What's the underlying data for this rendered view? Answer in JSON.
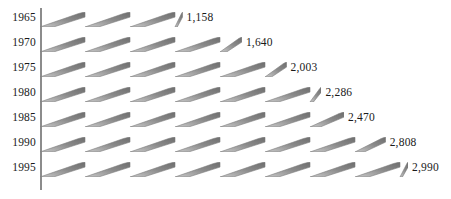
{
  "chart_data": {
    "type": "bar",
    "title": "",
    "subtitle": "",
    "xlabel": "",
    "ylabel": "",
    "orientation": "horizontal",
    "grid": false,
    "legend": null,
    "categories": [
      "1965",
      "1970",
      "1975",
      "1980",
      "1985",
      "1990",
      "1995"
    ],
    "values": [
      1158,
      1640,
      2003,
      2286,
      2470,
      2808,
      2990
    ],
    "value_labels": [
      "1,158",
      "1,640",
      "2,003",
      "2,286",
      "2,470",
      "2,808",
      "2,990"
    ],
    "xlim": [
      0,
      2990
    ],
    "bar_style": "sawtooth-zigzag",
    "bar_color": "#8a8a8a",
    "bar_highlight_color": "#6e6e6e",
    "axis_color": "#8c8c8c",
    "text_color": "#1a1a1a",
    "background_color": "#ffffff"
  },
  "rows": [
    {
      "year": "1965",
      "value": 1158,
      "label": "1,158"
    },
    {
      "year": "1970",
      "value": 1640,
      "label": "1,640"
    },
    {
      "year": "1975",
      "value": 2003,
      "label": "2,003"
    },
    {
      "year": "1980",
      "value": 2286,
      "label": "2,286"
    },
    {
      "year": "1985",
      "value": 2470,
      "label": "2,470"
    },
    {
      "year": "1990",
      "value": 2808,
      "label": "2,808"
    },
    {
      "year": "1995",
      "value": 2990,
      "label": "2,990"
    }
  ],
  "geometry": {
    "axis_x": 40,
    "axis_top": 8,
    "axis_bottom": 190,
    "row_top_first": 12,
    "row_step": 25,
    "bar_height": 15,
    "tooth_period": 45,
    "px_per_unit": 0.1231,
    "label_gap": 4
  }
}
